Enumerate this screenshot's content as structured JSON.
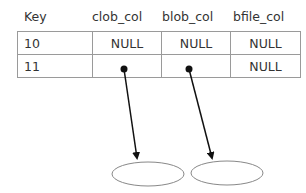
{
  "headers": [
    "Key",
    "clob_col",
    "blob_col",
    "bfile_col"
  ],
  "rows": [
    {
      "key": "10",
      "clob_col": "NULL",
      "blob_col": "NULL",
      "bfile_col": "NULL"
    },
    {
      "key": "11",
      "clob_col": "",
      "blob_col": "",
      "bfile_col": "NULL"
    }
  ],
  "pointers": [
    {
      "from": "clob_col row 11",
      "to": "clob-lob-locator-ellipse"
    },
    {
      "from": "blob_col row 11",
      "to": "blob-lob-locator-ellipse"
    }
  ]
}
